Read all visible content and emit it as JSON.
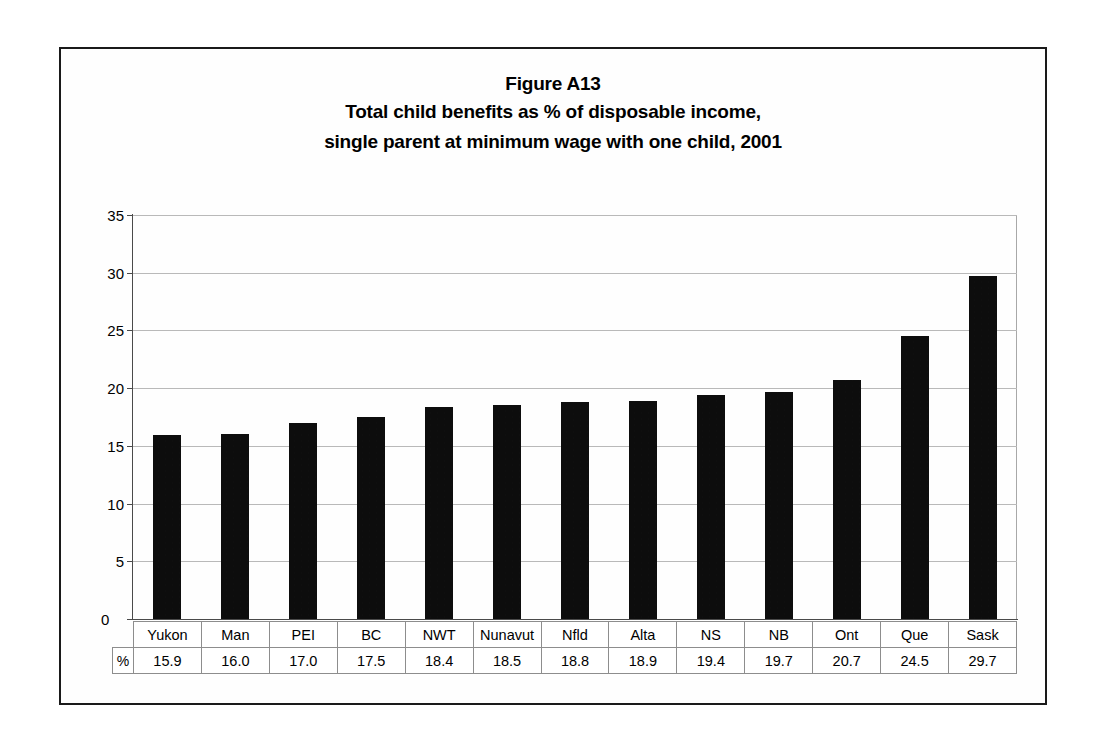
{
  "figure": {
    "title_main": "Figure A13",
    "title_sub_1": "Total child benefits as % of disposable income,",
    "title_sub_2": "single parent at minimum wage with one child, 2001",
    "unit_label": "%"
  },
  "chart_data": {
    "type": "bar",
    "xlabel": "",
    "ylabel": "",
    "ylim": [
      0,
      35
    ],
    "ytick_step": 5,
    "yticks": [
      "0",
      "5",
      "10",
      "15",
      "20",
      "25",
      "30",
      "35"
    ],
    "grid": true,
    "legend": false,
    "bar_color": "#0d0d0d",
    "categories": [
      "Yukon",
      "Man",
      "PEI",
      "BC",
      "NWT",
      "Nunavut",
      "Nfld",
      "Alta",
      "NS",
      "NB",
      "Ont",
      "Que",
      "Sask"
    ],
    "values": [
      15.9,
      16.0,
      17.0,
      17.5,
      18.4,
      18.5,
      18.8,
      18.9,
      19.4,
      19.7,
      20.7,
      24.5,
      29.7
    ],
    "value_labels": [
      "15.9",
      "16.0",
      "17.0",
      "17.5",
      "18.4",
      "18.5",
      "18.8",
      "18.9",
      "19.4",
      "19.7",
      "20.7",
      "24.5",
      "29.7"
    ]
  }
}
